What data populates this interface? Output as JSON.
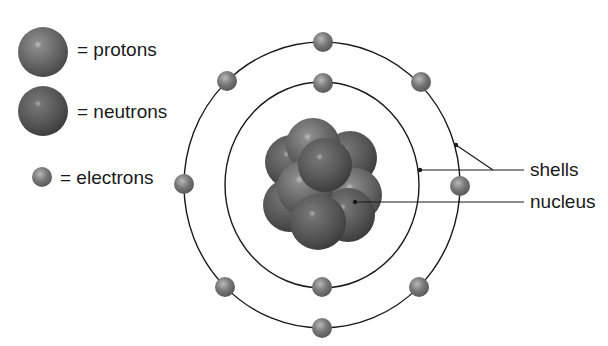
{
  "legend": {
    "protons": "= protons",
    "neutrons": "= neutrons",
    "electrons": "= electrons"
  },
  "labels": {
    "shells": "shells",
    "nucleus": "nucleus"
  },
  "colors": {
    "particle": "#6e6e6e",
    "line": "#1a1a1a",
    "background": "#ffffff"
  }
}
